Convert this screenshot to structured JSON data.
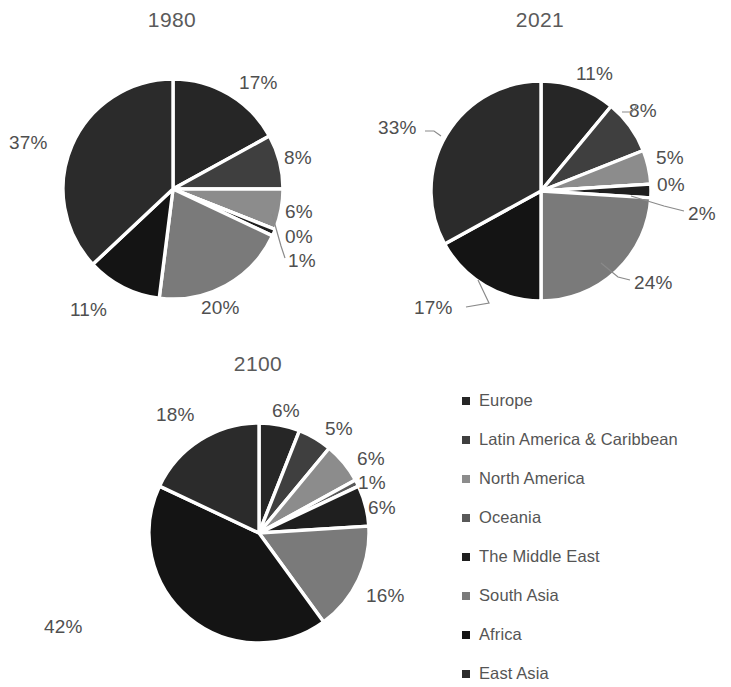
{
  "chart_data": [
    {
      "type": "pie",
      "title": "1980",
      "categories": [
        "Europe",
        "Latin America & Caribbean",
        "North America",
        "Oceania",
        "The Middle East",
        "South Asia",
        "Africa",
        "East Asia"
      ],
      "values": [
        17,
        8,
        6,
        0,
        1,
        20,
        11,
        37
      ],
      "labels": [
        "17%",
        "8%",
        "6%",
        "0%",
        "1%",
        "20%",
        "11%",
        "37%"
      ],
      "unit": "%",
      "legend_position": "bottom-right",
      "grid": false
    },
    {
      "type": "pie",
      "title": "2021",
      "categories": [
        "Europe",
        "Latin America & Caribbean",
        "North America",
        "Oceania",
        "The Middle East",
        "South Asia",
        "Africa",
        "East Asia"
      ],
      "values": [
        11,
        8,
        5,
        0,
        2,
        24,
        17,
        33
      ],
      "labels": [
        "11%",
        "8%",
        "5%",
        "0%",
        "2%",
        "24%",
        "17%",
        "33%"
      ],
      "unit": "%",
      "legend_position": "bottom-right",
      "grid": false
    },
    {
      "type": "pie",
      "title": "2100",
      "categories": [
        "Europe",
        "Latin America & Caribbean",
        "North America",
        "Oceania",
        "The Middle East",
        "South Asia",
        "Africa",
        "East Asia"
      ],
      "values": [
        6,
        5,
        6,
        1,
        6,
        16,
        42,
        18
      ],
      "labels": [
        "6%",
        "5%",
        "6%",
        "1%",
        "6%",
        "16%",
        "42%",
        "18%"
      ],
      "unit": "%",
      "legend_position": "bottom-right",
      "grid": false
    }
  ],
  "series_colors": [
    "#262626",
    "#3f3f3f",
    "#8c8c8c",
    "#595959",
    "#1f1f1f",
    "#7a7a7a",
    "#141414",
    "#2b2b2b"
  ],
  "charts": {
    "chart1": {
      "title": "1980",
      "labels": {
        "s0": "17%",
        "s1": "8%",
        "s2": "6%",
        "s3": "0%",
        "s4": "1%",
        "s5": "20%",
        "s6": "11%",
        "s7": "37%"
      }
    },
    "chart2": {
      "title": "2021",
      "labels": {
        "s0": "11%",
        "s1": "8%",
        "s2": "5%",
        "s3": "0%",
        "s4": "2%",
        "s5": "24%",
        "s6": "17%",
        "s7": "33%"
      }
    },
    "chart3": {
      "title": "2100",
      "labels": {
        "s0": "6%",
        "s1": "5%",
        "s2": "6%",
        "s3": "1%",
        "s4": "6%",
        "s5": "16%",
        "s6": "42%",
        "s7": "18%"
      }
    }
  },
  "legend": {
    "items": [
      {
        "label": "Europe",
        "color": "#262626"
      },
      {
        "label": "Latin America & Caribbean",
        "color": "#3f3f3f"
      },
      {
        "label": "North America",
        "color": "#8c8c8c"
      },
      {
        "label": "Oceania",
        "color": "#595959"
      },
      {
        "label": "The Middle East",
        "color": "#1f1f1f"
      },
      {
        "label": "South Asia",
        "color": "#7a7a7a"
      },
      {
        "label": "Africa",
        "color": "#141414"
      },
      {
        "label": "East Asia",
        "color": "#2b2b2b"
      }
    ]
  }
}
